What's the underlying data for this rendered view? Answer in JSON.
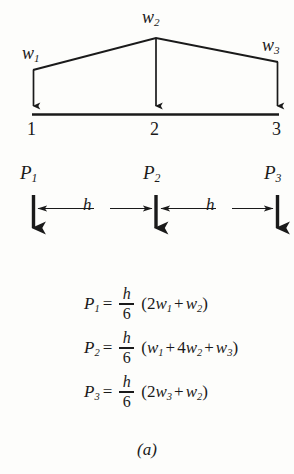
{
  "figure": {
    "caption": "(a)",
    "ink_color": "#1a1a1a",
    "background_color": "#fdfdfb"
  },
  "load_diagram": {
    "distributed_loads": [
      {
        "id": "w1",
        "label_base": "w",
        "label_sub": "1"
      },
      {
        "id": "w2",
        "label_base": "w",
        "label_sub": "2"
      },
      {
        "id": "w3",
        "label_base": "w",
        "label_sub": "3"
      }
    ],
    "nodes": [
      {
        "id": "node1",
        "label": "1"
      },
      {
        "id": "node2",
        "label": "2"
      },
      {
        "id": "node3",
        "label": "3"
      }
    ]
  },
  "resultant_forces": {
    "forces": [
      {
        "id": "P1",
        "label_base": "P",
        "label_sub": "1"
      },
      {
        "id": "P2",
        "label_base": "P",
        "label_sub": "2"
      },
      {
        "id": "P3",
        "label_base": "P",
        "label_sub": "3"
      }
    ],
    "spacings": [
      {
        "id": "h1",
        "label": "h"
      },
      {
        "id": "h2",
        "label": "h"
      }
    ]
  },
  "equations": [
    {
      "id": "eq1",
      "lhs_base": "P",
      "lhs_sub": "1",
      "equals": "=",
      "numerator": "h",
      "denominator": "6",
      "open_paren": "(",
      "term1_coeff": "2",
      "term1_base": "w",
      "term1_sub": "1",
      "plus": "+",
      "term2_coeff": "",
      "term2_base": "w",
      "term2_sub": "2",
      "close_paren": ")"
    },
    {
      "id": "eq2",
      "lhs_base": "P",
      "lhs_sub": "2",
      "equals": "=",
      "numerator": "h",
      "denominator": "6",
      "open_paren": "(",
      "term1_coeff": "",
      "term1_base": "w",
      "term1_sub": "1",
      "plus": "+",
      "term2_coeff": "4",
      "term2_base": "w",
      "term2_sub": "2",
      "plus2": "+",
      "term3_coeff": "",
      "term3_base": "w",
      "term3_sub": "3",
      "close_paren": ")"
    },
    {
      "id": "eq3",
      "lhs_base": "P",
      "lhs_sub": "3",
      "equals": "=",
      "numerator": "h",
      "denominator": "6",
      "open_paren": "(",
      "term1_coeff": "2",
      "term1_base": "w",
      "term1_sub": "3",
      "plus": "+",
      "term2_coeff": "",
      "term2_base": "w",
      "term2_sub": "2",
      "close_paren": ")"
    }
  ]
}
